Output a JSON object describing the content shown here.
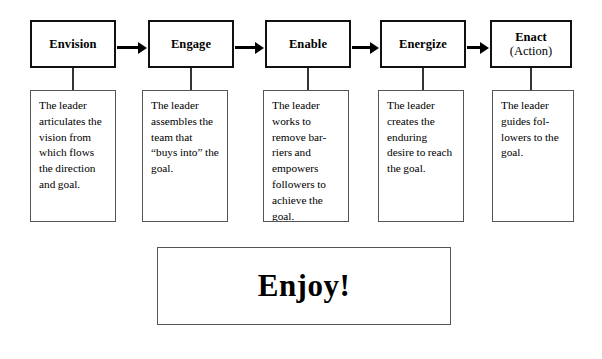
{
  "diagram": {
    "background_color": "#ffffff",
    "line_color": "#111111",
    "text_color": "#000000",
    "stages": [
      {
        "id": "envision",
        "title": "Envision",
        "subtitle": "",
        "description": "The leader articulates the vision from which flows the direction and goal.",
        "box_x": 30,
        "box_width": 86,
        "desc_x": 30,
        "desc_width": 86
      },
      {
        "id": "engage",
        "title": "Engage",
        "subtitle": "",
        "description": "The leader assembles the team that “buys into” the goal.",
        "box_x": 148,
        "box_width": 86,
        "desc_x": 142,
        "desc_width": 86
      },
      {
        "id": "enable",
        "title": "Enable",
        "subtitle": "",
        "description": "The leader works to remove bar-riers and empowers followers to achieve the goal.",
        "box_x": 265,
        "box_width": 86,
        "desc_x": 263,
        "desc_width": 86
      },
      {
        "id": "energize",
        "title": "Energize",
        "subtitle": "",
        "description": "The leader creates the enduring desire to reach the goal.",
        "box_x": 380,
        "box_width": 86,
        "desc_x": 378,
        "desc_width": 86
      },
      {
        "id": "enact",
        "title": "Enact",
        "subtitle": "(Action)",
        "description": "The leader guides fol-lowers to the goal.",
        "box_x": 490,
        "box_width": 82,
        "desc_x": 492,
        "desc_width": 82
      }
    ],
    "arrows": [
      {
        "id": "arrow-envision-engage",
        "x": 117,
        "width": 30
      },
      {
        "id": "arrow-engage-enable",
        "x": 235,
        "width": 29
      },
      {
        "id": "arrow-enable-energize",
        "x": 352,
        "width": 27
      },
      {
        "id": "arrow-energize-enact",
        "x": 467,
        "width": 22
      }
    ],
    "footer": {
      "label": "Enjoy!"
    }
  }
}
